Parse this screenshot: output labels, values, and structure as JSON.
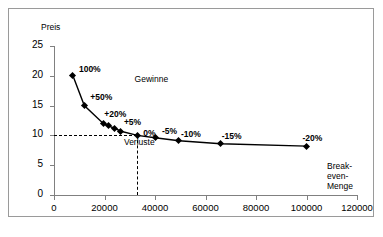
{
  "chart_data": {
    "type": "line",
    "title": "",
    "xlabel": "",
    "ylabel": "Preis",
    "xlim": [
      0,
      120000
    ],
    "ylim": [
      0,
      25
    ],
    "xticks": [
      "0",
      "20000",
      "40000",
      "60000",
      "80000",
      "100000",
      "120000"
    ],
    "xtick_values": [
      0,
      20000,
      40000,
      60000,
      80000,
      100000,
      120000
    ],
    "yticks": [
      "0",
      "5",
      "10",
      "15",
      "20",
      "25"
    ],
    "ytick_values": [
      0,
      5,
      10,
      15,
      20,
      25
    ],
    "grid": false,
    "legend": "none",
    "series": [
      {
        "name": "Preis-Absatz-Funktion",
        "x": [
          7500,
          12000,
          19500,
          21500,
          24000,
          26500,
          33000,
          40000,
          49500,
          66000,
          100000
        ],
        "y": [
          20.0,
          15.0,
          12.0,
          11.6,
          11.2,
          10.7,
          10.0,
          9.6,
          9.1,
          8.6,
          8.2
        ],
        "point_labels": [
          "100%",
          "+50%",
          "+20%",
          "",
          "",
          "+5%",
          "0%",
          "-5%",
          "-10%",
          "-15%",
          "-20%"
        ]
      }
    ],
    "annotations": [
      {
        "text": "Gewinne",
        "x": 43000,
        "y": 18.2
      },
      {
        "text": "Verluste",
        "x": 38000,
        "y": 7.6
      },
      {
        "text": "Break-even-Menge",
        "x": 115000,
        "y": 5.5
      }
    ],
    "reference_lines": {
      "breakeven_price": 10,
      "breakeven_quantity": 33000,
      "style": "dashed"
    }
  },
  "axes": {
    "y_title": "Preis",
    "y_tick_labels": [
      "25",
      "20",
      "15",
      "10",
      "5",
      "0"
    ],
    "x_tick_labels": [
      "0",
      "20000",
      "40000",
      "60000",
      "80000",
      "100000",
      "120000"
    ]
  },
  "labels": {
    "gewinne": "Gewinne",
    "verluste": "Verluste",
    "breakeven_line1": "Break-",
    "breakeven_line2": "even-",
    "breakeven_line3": "Menge"
  },
  "points": [
    {
      "label": "100%",
      "qty": 7500,
      "price": 20.0
    },
    {
      "label": "+50%",
      "qty": 12000,
      "price": 15.0
    },
    {
      "label": "+20%",
      "qty": 19500,
      "price": 12.0
    },
    {
      "label": "",
      "qty": 21500,
      "price": 11.6
    },
    {
      "label": "",
      "qty": 24000,
      "price": 11.2
    },
    {
      "label": "+5%",
      "qty": 26500,
      "price": 10.7
    },
    {
      "label": "0%",
      "qty": 33000,
      "price": 10.0
    },
    {
      "label": "-5%",
      "qty": 40000,
      "price": 9.6
    },
    {
      "label": "-10%",
      "qty": 49500,
      "price": 9.1
    },
    {
      "label": "-15%",
      "qty": 66000,
      "price": 8.6
    },
    {
      "label": "-20%",
      "qty": 100000,
      "price": 8.2
    }
  ],
  "colors": {
    "series": "#000000",
    "axis": "#808080",
    "frame": "#9a9a9a",
    "background": "#ffffff",
    "text": "#000000"
  }
}
